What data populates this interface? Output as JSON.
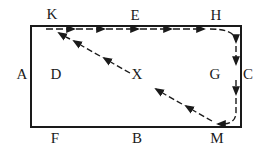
{
  "diagram": {
    "type": "path-diagram",
    "colors": {
      "line": "#1a1a1a",
      "background": "#ffffff"
    },
    "labels": {
      "K": "K",
      "E": "E",
      "H": "H",
      "A": "A",
      "D": "D",
      "X": "X",
      "G": "G",
      "C": "C",
      "F": "F",
      "B": "B",
      "M": "M"
    },
    "route": [
      "K",
      "E",
      "H",
      "C",
      "M",
      "X",
      "K"
    ],
    "edges": [
      {
        "from": "K",
        "to": "H",
        "style": "dashed-arrow",
        "via": "E"
      },
      {
        "from": "H",
        "to": "M",
        "style": "dashed-arrow",
        "via": "C",
        "curved_corners": true
      },
      {
        "from": "M",
        "to": "K",
        "style": "dashed-arrow",
        "via": "X"
      }
    ]
  }
}
